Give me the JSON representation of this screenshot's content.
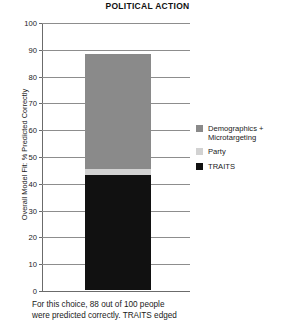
{
  "chart_data": {
    "type": "bar",
    "title": "POLITICAL ACTION",
    "xlabel": "",
    "ylabel": "Overall Model Fit: % Predicted Correctly",
    "ylim": [
      0,
      100
    ],
    "ytick_labels": [
      "100",
      "90",
      "80",
      "70",
      "60",
      "50",
      "40",
      "30",
      "20",
      "10",
      "0"
    ],
    "ytick_values": [
      100,
      90,
      80,
      70,
      60,
      50,
      40,
      30,
      20,
      10,
      0
    ],
    "grid": true,
    "stacked": true,
    "legend_position": "right",
    "categories": [
      "Political Action"
    ],
    "total": 88,
    "series": [
      {
        "name": "TRAITS",
        "values": [
          43
        ],
        "color": "#111111"
      },
      {
        "name": "Party",
        "values": [
          2
        ],
        "color": "#d2d2d2"
      },
      {
        "name": "Demographics + Microtargeting",
        "values": [
          43
        ],
        "color": "#8a8a8a"
      }
    ]
  },
  "legend": {
    "items": [
      {
        "label": "Demographics + Microtargeting",
        "color": "#8a8a8a"
      },
      {
        "label": "Party",
        "color": "#d2d2d2"
      },
      {
        "label": "TRAITS",
        "color": "#111111"
      }
    ]
  },
  "caption": {
    "line1": "For this choice, 88 out of 100 people",
    "line2": "were predicted correctly. TRAITS edged"
  }
}
